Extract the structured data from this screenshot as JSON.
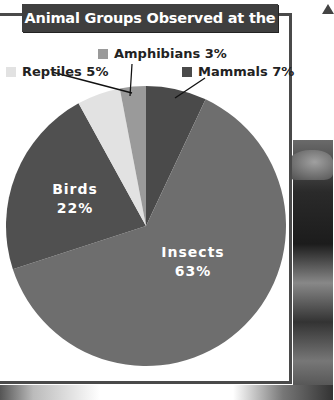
{
  "title": "Animal Groups Observed at the Park",
  "chart_data": {
    "type": "pie",
    "title": "Animal Groups Observed at the Park",
    "categories": [
      "Mammals",
      "Insects",
      "Birds",
      "Reptiles",
      "Amphibians"
    ],
    "values": [
      7,
      63,
      22,
      5,
      3
    ],
    "unit": "%",
    "colors": [
      "#4a4a4a",
      "#6e6e6e",
      "#505050",
      "#e2e2e2",
      "#9a9a9a"
    ],
    "labels_inside": [
      "Insects",
      "Birds"
    ],
    "labels_outside": [
      "Mammals",
      "Reptiles",
      "Amphibians"
    ]
  },
  "labels": {
    "amphibians": "Amphibians 3%",
    "reptiles": "Reptiles 5%",
    "mammals": "Mammals 7%",
    "birds_name": "Birds",
    "birds_pct": "22%",
    "insects_name": "Insects",
    "insects_pct": "63%"
  }
}
